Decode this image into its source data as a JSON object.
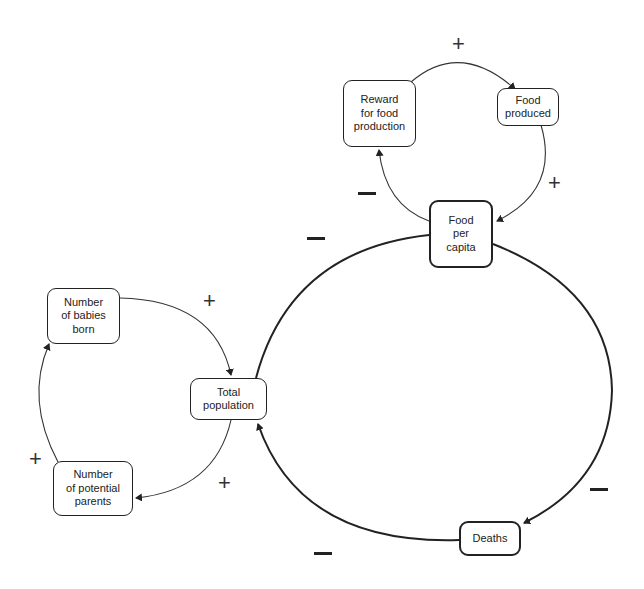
{
  "diagram": {
    "type": "causal-loop-diagram",
    "nodes": {
      "reward": "Reward\nfor food\nproduction",
      "food_produced": "Food\nproduced",
      "food_per_capita": "Food\nper\ncapita",
      "babies": "Number\nof babies\nborn",
      "total_population": "Total\npopulation",
      "parents": "Number\nof potential\nparents",
      "deaths": "Deaths"
    },
    "signs": {
      "reward_to_food_produced": "+",
      "food_produced_to_food_per_capita": "+",
      "food_per_capita_to_reward": "−",
      "food_per_capita_to_deaths_label_top": "−",
      "food_per_capita_to_deaths": "−",
      "deaths_to_total_population": "−",
      "babies_to_total_population": "+",
      "total_population_to_parents": "+",
      "parents_to_babies": "+"
    },
    "links": [
      {
        "from": "Reward for food production",
        "to": "Food produced",
        "sign": "+"
      },
      {
        "from": "Food produced",
        "to": "Food per capita",
        "sign": "+"
      },
      {
        "from": "Food per capita",
        "to": "Reward for food production",
        "sign": "−"
      },
      {
        "from": "Total population",
        "to": "Food per capita",
        "sign": "−"
      },
      {
        "from": "Food per capita",
        "to": "Deaths",
        "sign": "−"
      },
      {
        "from": "Deaths",
        "to": "Total population",
        "sign": "−"
      },
      {
        "from": "Number of babies born",
        "to": "Total population",
        "sign": "+"
      },
      {
        "from": "Total population",
        "to": "Number of potential parents",
        "sign": "+"
      },
      {
        "from": "Number of potential parents",
        "to": "Number of babies born",
        "sign": "+"
      }
    ]
  }
}
